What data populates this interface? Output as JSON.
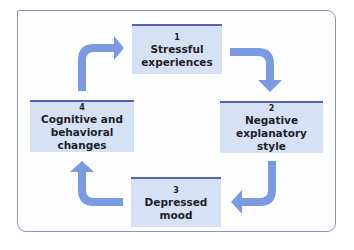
{
  "diagram": {
    "type": "cycle",
    "colors": {
      "frame_border": "#8d8fc4",
      "box_fill": "#d5e1f5",
      "box_top_border": "#5a5fb0",
      "arrow": "#7a9be0",
      "text": "#1e1e28"
    },
    "steps": [
      {
        "number": "1",
        "label": "Stressful experiences",
        "lines": [
          "Stressful",
          "experiences"
        ]
      },
      {
        "number": "2",
        "label": "Negative explanatory style",
        "lines": [
          "Negative",
          "explanatory style"
        ]
      },
      {
        "number": "3",
        "label": "Depressed mood",
        "lines": [
          "Depressed",
          "mood"
        ]
      },
      {
        "number": "4",
        "label": "Cognitive and behavioral changes",
        "lines": [
          "Cognitive and",
          "behavioral changes"
        ]
      }
    ],
    "arrows": [
      {
        "from": "1",
        "to": "2",
        "icon": "curved-arrow-right-down-icon"
      },
      {
        "from": "2",
        "to": "3",
        "icon": "curved-arrow-down-left-icon"
      },
      {
        "from": "3",
        "to": "4",
        "icon": "curved-arrow-left-up-icon"
      },
      {
        "from": "4",
        "to": "1",
        "icon": "curved-arrow-up-right-icon"
      }
    ]
  }
}
